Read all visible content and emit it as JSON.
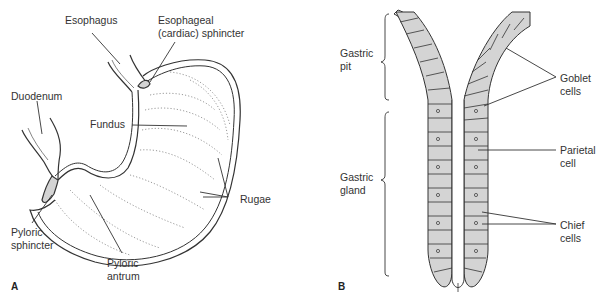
{
  "panel_a": {
    "letter": "A",
    "labels": {
      "esophagus": "Esophagus",
      "esophageal_sphincter_1": "Esophageal",
      "esophageal_sphincter_2": "(cardiac) sphincter",
      "duodenum": "Duodenum",
      "fundus": "Fundus",
      "rugae": "Rugae",
      "pyloric_sphincter_1": "Pyloric",
      "pyloric_sphincter_2": "sphincter",
      "pyloric_antrum_1": "Pyloric",
      "pyloric_antrum_2": "antrum"
    }
  },
  "panel_b": {
    "letter": "B",
    "labels": {
      "gastric_pit_1": "Gastric",
      "gastric_pit_2": "pit",
      "gastric_gland_1": "Gastric",
      "gastric_gland_2": "gland",
      "goblet_1": "Goblet",
      "goblet_2": "cells",
      "parietal_1": "Parietal",
      "parietal_2": "cell",
      "chief_1": "Chief",
      "chief_2": "cells"
    }
  },
  "colors": {
    "line": "#333333",
    "fill": "#d4d4d4",
    "background": "#ffffff"
  }
}
